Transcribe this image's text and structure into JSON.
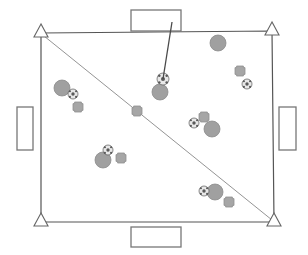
{
  "diagram": {
    "canvas": {
      "width": 308,
      "height": 255
    },
    "colors": {
      "field_stroke": "#555555",
      "goal_stroke": "#777777",
      "goal_fill": "#ffffff",
      "corner_marker_stroke": "#666666",
      "corner_marker_fill": "#ffffff",
      "divider_line": "#888888",
      "pointer_line": "#4a4a4a",
      "robot_fill": "#a0a0a0",
      "robot_stroke": "#8a8a8a",
      "cross_fill": "#a6a6a6",
      "cross_stroke": "#8f8f8f",
      "ball_light": "#e8e8e8",
      "ball_dark": "#5a5a5a",
      "background": "#ffffff"
    },
    "field": {
      "label": "field-boundary",
      "corners": [
        {
          "name": "top-left",
          "x": 41,
          "y": 33
        },
        {
          "name": "top-right",
          "x": 272,
          "y": 31
        },
        {
          "name": "bottom-right",
          "x": 274,
          "y": 222
        },
        {
          "name": "bottom-left",
          "x": 41,
          "y": 222
        }
      ]
    },
    "corner_markers": [
      {
        "name": "corner-marker-top-left",
        "x": 41,
        "y": 33,
        "size": 9
      },
      {
        "name": "corner-marker-top-right",
        "x": 272,
        "y": 31,
        "size": 9
      },
      {
        "name": "corner-marker-bottom-right",
        "x": 274,
        "y": 222,
        "size": 9
      },
      {
        "name": "corner-marker-bottom-left",
        "x": 41,
        "y": 222,
        "size": 9
      }
    ],
    "divider_line": {
      "name": "diagonal-divider",
      "x1": 44,
      "y1": 36,
      "x2": 272,
      "y2": 220
    },
    "goals": [
      {
        "name": "goal-top",
        "x": 131,
        "y": 10,
        "w": 50,
        "h": 21
      },
      {
        "name": "goal-bottom",
        "x": 131,
        "y": 227,
        "w": 50,
        "h": 20
      },
      {
        "name": "goal-left",
        "x": 17,
        "y": 107,
        "w": 16,
        "h": 43
      },
      {
        "name": "goal-right",
        "x": 279,
        "y": 107,
        "w": 17,
        "h": 43
      }
    ],
    "pointer": {
      "name": "annotation-pointer",
      "from_x": 172,
      "from_y": 22,
      "to_x": 163,
      "to_y": 79
    },
    "pieces": [
      {
        "name": "robot-circle",
        "type": "circle",
        "x": 218,
        "y": 43,
        "r": 8
      },
      {
        "name": "robot-circle",
        "type": "circle",
        "x": 62,
        "y": 88,
        "r": 8
      },
      {
        "name": "robot-circle",
        "type": "circle",
        "x": 160,
        "y": 92,
        "r": 8
      },
      {
        "name": "robot-circle",
        "type": "circle",
        "x": 212,
        "y": 129,
        "r": 8
      },
      {
        "name": "robot-circle",
        "type": "circle",
        "x": 103,
        "y": 160,
        "r": 8
      },
      {
        "name": "robot-circle",
        "type": "circle",
        "x": 215,
        "y": 192,
        "r": 8
      },
      {
        "name": "robot-cross",
        "type": "cross",
        "x": 240,
        "y": 71,
        "s": 10
      },
      {
        "name": "robot-cross",
        "type": "cross",
        "x": 78,
        "y": 107,
        "s": 10
      },
      {
        "name": "robot-cross",
        "type": "cross",
        "x": 137,
        "y": 111,
        "s": 10
      },
      {
        "name": "robot-cross",
        "type": "cross",
        "x": 204,
        "y": 117,
        "s": 10
      },
      {
        "name": "robot-cross",
        "type": "cross",
        "x": 121,
        "y": 158,
        "s": 10
      },
      {
        "name": "robot-cross",
        "type": "cross",
        "x": 229,
        "y": 202,
        "s": 10
      },
      {
        "name": "soccer-ball",
        "type": "ball",
        "x": 163,
        "y": 79,
        "r": 6
      },
      {
        "name": "soccer-ball",
        "type": "ball",
        "x": 73,
        "y": 94,
        "r": 5
      },
      {
        "name": "soccer-ball",
        "type": "ball",
        "x": 247,
        "y": 84,
        "r": 5
      },
      {
        "name": "soccer-ball",
        "type": "ball",
        "x": 194,
        "y": 123,
        "r": 5
      },
      {
        "name": "soccer-ball",
        "type": "ball",
        "x": 108,
        "y": 150,
        "r": 5
      },
      {
        "name": "soccer-ball",
        "type": "ball",
        "x": 204,
        "y": 191,
        "r": 5
      }
    ]
  }
}
